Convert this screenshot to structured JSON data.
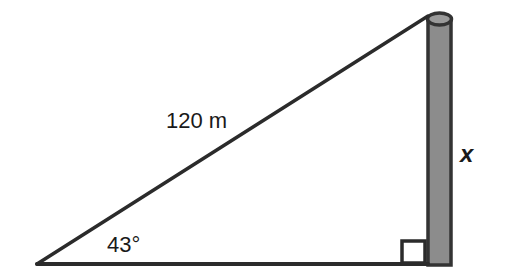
{
  "diagram": {
    "type": "right-triangle-with-pole",
    "labels": {
      "hypotenuse": "120 m",
      "angle": "43°",
      "opposite_side": "x"
    },
    "colors": {
      "line": "#2b2b2b",
      "pole_fill": "#8c8c8c",
      "pole_outline": "#333333",
      "background": "#ffffff"
    }
  }
}
